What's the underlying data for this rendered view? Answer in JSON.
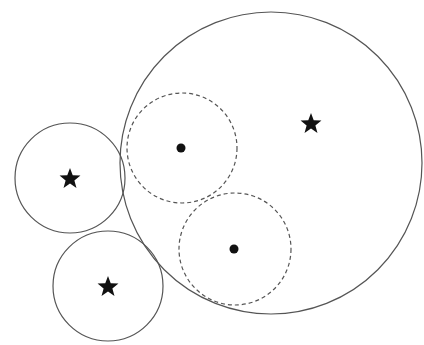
{
  "diagram": {
    "width": 424,
    "height": 345,
    "background": "#ffffff",
    "stroke_color": "#555555",
    "marker_color": "#111111",
    "solid_circles": [
      {
        "id": "large",
        "cx": 271,
        "cy": 163,
        "r": 151
      },
      {
        "id": "left",
        "cx": 70,
        "cy": 178,
        "r": 55
      },
      {
        "id": "bottom",
        "cx": 108,
        "cy": 286,
        "r": 55
      }
    ],
    "dashed_circles": [
      {
        "id": "dashed-upper",
        "cx": 182,
        "cy": 148,
        "r": 55
      },
      {
        "id": "dashed-lower",
        "cx": 235,
        "cy": 249,
        "r": 56
      }
    ],
    "stars": [
      {
        "x": 311,
        "y": 124,
        "size": 22
      },
      {
        "x": 70,
        "y": 179,
        "size": 22
      },
      {
        "x": 108,
        "y": 287,
        "size": 22
      }
    ],
    "dots": [
      {
        "x": 181,
        "y": 148,
        "r": 4.5
      },
      {
        "x": 234,
        "y": 249,
        "r": 4.5
      }
    ]
  }
}
